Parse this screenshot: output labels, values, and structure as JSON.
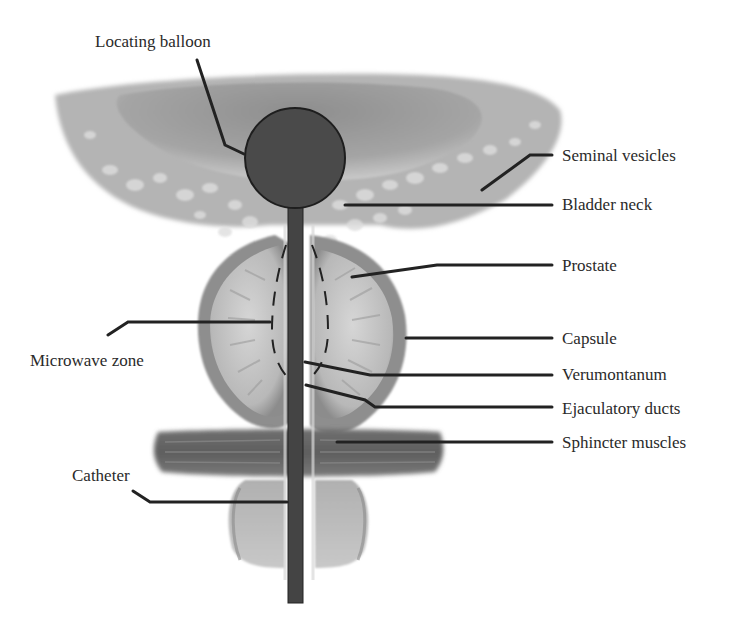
{
  "diagram": {
    "colors": {
      "background": "#ffffff",
      "leader_line": "#222222",
      "balloon_fill": "#4a4a4a",
      "catheter_fill": "#444444",
      "tissue_light": "#c9c9c9",
      "tissue_mid": "#9a9a9a",
      "tissue_dark": "#6e6e6e",
      "label_text": "#2a2a2a"
    },
    "labels": {
      "locating_balloon": "Locating balloon",
      "seminal_vesicles": "Seminal vesicles",
      "bladder_neck": "Bladder neck",
      "prostate": "Prostate",
      "capsule": "Capsule",
      "microwave_zone": "Microwave zone",
      "verumontanum": "Verumontanum",
      "ejaculatory_ducts": "Ejaculatory ducts",
      "sphincter_muscles": "Sphincter muscles",
      "catheter": "Catheter"
    }
  }
}
